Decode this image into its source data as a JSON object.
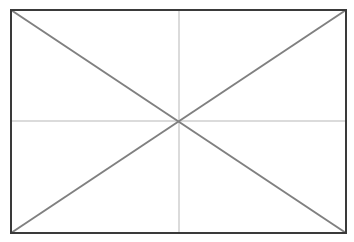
{
  "diagram": {
    "canvas": {
      "width": 354,
      "height": 242,
      "background": "#ffffff"
    },
    "rectangle": {
      "x1": 11,
      "y1": 10,
      "x2": 346,
      "y2": 233,
      "stroke": "#3a3a3a",
      "stroke_width": 2
    },
    "diagonals": {
      "stroke": "#808080",
      "stroke_width": 2
    },
    "midlines": {
      "stroke": "#cfcfcf",
      "stroke_width": 1.5
    },
    "center": {
      "x": 179,
      "y": 121
    }
  }
}
